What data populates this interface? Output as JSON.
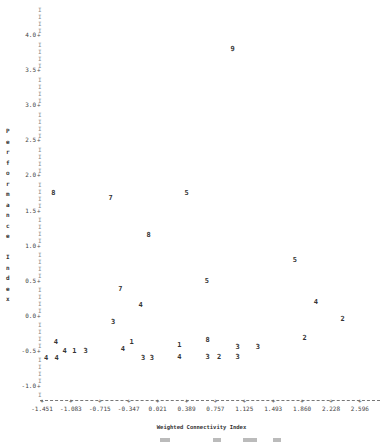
{
  "chart_data": {
    "type": "scatter",
    "title": "",
    "xlabel": "Weighted Connectivity Index",
    "ylabel": "Performance Index",
    "xlim": [
      -1.451,
      2.596
    ],
    "ylim": [
      -1.2,
      4.2
    ],
    "grid": false,
    "legend": null,
    "marker_style": "digit labels (cluster/group ids)",
    "x_ticks": [
      "-1.451",
      "-1.083",
      "-0.715",
      "-0.347",
      "0.021",
      "0.389",
      "0.757",
      "1.125",
      "1.493",
      "1.860",
      "2.228",
      "2.596"
    ],
    "y_ticks": [
      "4.0",
      "3.5",
      "3.0",
      "2.5",
      "2.0",
      "1.5",
      "1.0",
      "0.5",
      "0.0",
      "-0.5",
      "-1.0"
    ],
    "points": [
      {
        "label": "9",
        "x": 0.86,
        "y": 3.8
      },
      {
        "label": "8",
        "x": -1.36,
        "y": 1.75
      },
      {
        "label": "7",
        "x": -0.65,
        "y": 1.68
      },
      {
        "label": "5",
        "x": 0.29,
        "y": 1.75
      },
      {
        "label": "8",
        "x": -0.18,
        "y": 1.15
      },
      {
        "label": "5",
        "x": 1.63,
        "y": 0.8
      },
      {
        "label": "5",
        "x": 0.54,
        "y": 0.5
      },
      {
        "label": "7",
        "x": -0.53,
        "y": 0.38
      },
      {
        "label": "4",
        "x": -0.28,
        "y": 0.16
      },
      {
        "label": "4",
        "x": 1.89,
        "y": 0.2
      },
      {
        "label": "3",
        "x": -0.62,
        "y": -0.09
      },
      {
        "label": "2",
        "x": 2.22,
        "y": -0.05
      },
      {
        "label": "2",
        "x": 1.75,
        "y": -0.32
      },
      {
        "label": "4",
        "x": -1.33,
        "y": -0.37
      },
      {
        "label": "1",
        "x": -0.39,
        "y": -0.38
      },
      {
        "label": "8",
        "x": 0.55,
        "y": -0.35
      },
      {
        "label": "1",
        "x": 0.2,
        "y": -0.41
      },
      {
        "label": "4",
        "x": -1.22,
        "y": -0.5
      },
      {
        "label": "1",
        "x": -1.1,
        "y": -0.5
      },
      {
        "label": "3",
        "x": -0.96,
        "y": -0.5
      },
      {
        "label": "4",
        "x": -0.5,
        "y": -0.48
      },
      {
        "label": "3",
        "x": 0.92,
        "y": -0.45
      },
      {
        "label": "3",
        "x": 1.17,
        "y": -0.45
      },
      {
        "label": "4",
        "x": -1.45,
        "y": -0.6
      },
      {
        "label": "4",
        "x": -1.32,
        "y": -0.6
      },
      {
        "label": "3",
        "x": -0.25,
        "y": -0.6
      },
      {
        "label": "3",
        "x": -0.14,
        "y": -0.6
      },
      {
        "label": "4",
        "x": 0.2,
        "y": -0.59
      },
      {
        "label": "3",
        "x": 0.55,
        "y": -0.59
      },
      {
        "label": "2",
        "x": 0.69,
        "y": -0.59
      },
      {
        "label": "3",
        "x": 0.92,
        "y": -0.59
      }
    ]
  },
  "axis": {
    "ylabel_chars": [
      "P",
      "e",
      "r",
      "f",
      "o",
      "r",
      "m",
      "a",
      "n",
      "c",
      "e",
      "",
      "I",
      "n",
      "d",
      "e",
      "x"
    ],
    "tick_mark": "+",
    "bar_mark": "I"
  }
}
